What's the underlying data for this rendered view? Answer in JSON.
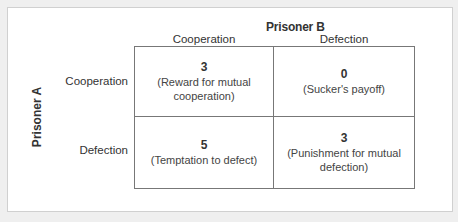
{
  "diagram": {
    "column_player": "Prisoner B",
    "row_player": "Prisoner A",
    "columns": [
      "Cooperation",
      "Defection"
    ],
    "rows": [
      "Cooperation",
      "Defection"
    ],
    "cells": [
      [
        {
          "payoff": "3",
          "description": "(Reward for mutual cooperation)"
        },
        {
          "payoff": "0",
          "description": "(Sucker's payoff)"
        }
      ],
      [
        {
          "payoff": "5",
          "description": "(Temptation to defect)"
        },
        {
          "payoff": "3",
          "description": "(Punishment for mutual defection)"
        }
      ]
    ]
  },
  "colors": {
    "background": "#efefef",
    "panel": "#ffffff",
    "grid_line": "#777777",
    "text": "#333333"
  }
}
